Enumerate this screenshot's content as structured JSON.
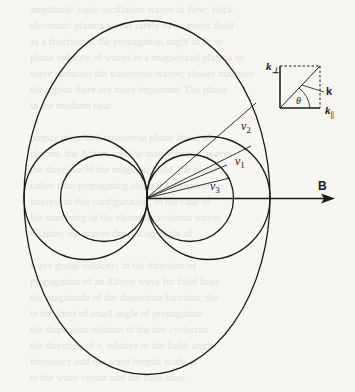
{
  "figure": {
    "type": "phase-velocity-polar-diagram",
    "labels": {
      "v1": "v",
      "v1_sub": "1",
      "v2": "v",
      "v2_sub": "2",
      "v3": "v",
      "v3_sub": "3",
      "B": "B"
    },
    "inset": {
      "k_perp": "k",
      "k_perp_sub": "⊥",
      "k_par": "k",
      "k_par_sub": "||",
      "k": "k",
      "theta": "θ"
    },
    "origin": [
      147,
      198
    ],
    "shapes": {
      "outer_ellipse": {
        "cx": 147,
        "cy": 197.5,
        "rx": 123,
        "ry": 177
      },
      "medium_circles": [
        {
          "cx": 85.5,
          "cy": 198,
          "r": 61.5
        },
        {
          "cx": 208.5,
          "cy": 198,
          "r": 61.5
        }
      ],
      "small_circles": [
        {
          "cx": 104,
          "cy": 198,
          "r": 43.5
        },
        {
          "cx": 190,
          "cy": 198,
          "r": 43.5
        }
      ]
    },
    "rays": [
      {
        "name": "v2",
        "to": [
          256,
          103
        ]
      },
      {
        "name": "v1",
        "to": [
          251,
          146
        ]
      },
      {
        "name": "ray-small-a",
        "to": [
          227,
          165
        ]
      },
      {
        "name": "v3",
        "to": [
          230,
          178
        ]
      }
    ],
    "colors": {
      "ink": "#1a1a1a",
      "paper": "#f7f6f3",
      "bleed": "#e4e2dd"
    }
  },
  "background_bleed_text": [
    "amplitude: ionic oscillation waves in flow; thick",
    "electronic plasma waves rarely in magnetic field",
    "as a function of the propagation angle to B; in",
    "phase velocity of waves in a magnetized plasma sp",
    "wave surfaces; the transverse waves; slower magneto",
    "the region there are more important. The phase",
    "in the medium near",
    "",
    "propagation with transverse phase ahead of",
    "plasma; the Alfven and the magnetosonic waves",
    "the direction of the magnetic field; the phase",
    "rather than propagating along the direction",
    "interest in this configuration; in the case of",
    "the scattering of the electron cyclotron waves",
    "relation; the waves depend on angle of",
    "",
    "wave group velocity; in the direction of",
    "propagation of an Alfven wave for field lines",
    "the magnitude of the dispersion function; the",
    "in the limit of small angle of propagation",
    "the dispersion relation of the ion cyclotron",
    "the direction of v, relative to the field; angle",
    "frequency and the wave length; scale of",
    "to the wave vector and the field lines"
  ]
}
